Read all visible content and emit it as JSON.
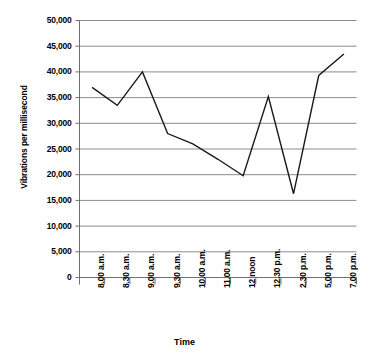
{
  "chart_data": {
    "type": "line",
    "title": "",
    "xlabel": "Time",
    "ylabel": "Vibrations per millisecond",
    "categories": [
      "8.00 a.m.",
      "8.30 a.m.",
      "9.00 a.m.",
      "9.30 a.m.",
      "10.00 a.m.",
      "11.00 a.m.",
      "12 noon",
      "12.30 p.m.",
      "2.30 p.m.",
      "5.00 p.m.",
      "7.00 p.m."
    ],
    "values": [
      37000,
      33500,
      40000,
      28000,
      26000,
      23000,
      19800,
      35200,
      16300,
      39300,
      43500
    ],
    "ylim": [
      0,
      50000
    ],
    "yticks": [
      0,
      5000,
      10000,
      15000,
      20000,
      25000,
      30000,
      35000,
      40000,
      45000,
      50000
    ],
    "ytick_labels": [
      "0",
      "5,000",
      "10,000",
      "15,000",
      "20,000",
      "25,000",
      "30,000",
      "35,000",
      "40,000",
      "45,000",
      "50,000"
    ],
    "grid": true,
    "grid_axis": "y",
    "legend": "none",
    "line_color": "#1a1a1a",
    "grid_color": "#8c8c8c",
    "axis_color": "#6e6e6e",
    "markers": false
  }
}
